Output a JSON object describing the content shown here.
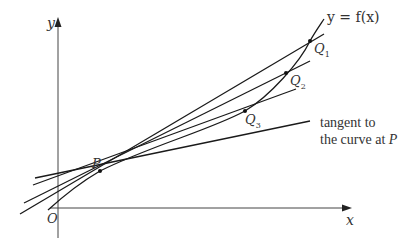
{
  "diagram": {
    "axes": {
      "x_label": "x",
      "y_label": "y",
      "origin_label": "O"
    },
    "curve_label": "y = f(x)",
    "points": {
      "P": "P",
      "Q1": "Q",
      "Q1_sub": "1",
      "Q2": "Q",
      "Q2_sub": "2",
      "Q3": "Q",
      "Q3_sub": "3"
    },
    "annotation": {
      "line1": "tangent to",
      "line2_prefix": "the curve at ",
      "line2_point": "P"
    },
    "colors": {
      "line": "#1a1a1a",
      "axis": "#333333",
      "text": "#333333",
      "background": "#ffffff"
    }
  }
}
